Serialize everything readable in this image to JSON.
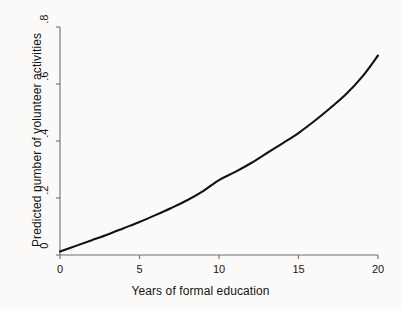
{
  "figure": {
    "background_color": "#fbfaf8",
    "axis_color": "#6e6e6e",
    "line_color": "#111111"
  },
  "chart_data": {
    "type": "line",
    "title": "",
    "subtitle": "",
    "xlabel": "Years of formal education",
    "ylabel": "Predicted number of volunteer activities",
    "xlim": [
      0,
      20
    ],
    "ylim": [
      0,
      0.8
    ],
    "xticks": [
      0,
      5,
      10,
      15,
      20
    ],
    "xtick_labels": [
      "0",
      "5",
      "10",
      "15",
      "20"
    ],
    "yticks": [
      0,
      0.2,
      0.4,
      0.6,
      0.8
    ],
    "ytick_labels": [
      "0",
      ".2",
      ".4",
      ".6",
      ".8"
    ],
    "grid": false,
    "legend": null,
    "legend_position": "none",
    "annotations": [],
    "series": [
      {
        "name": "Predicted volunteer activities",
        "color": "#111111",
        "x": [
          0,
          1,
          2,
          3,
          4,
          5,
          6,
          7,
          8,
          9,
          10,
          11,
          12,
          13,
          14,
          15,
          16,
          17,
          18,
          19,
          20
        ],
        "values": [
          0.012,
          0.032,
          0.052,
          0.072,
          0.094,
          0.116,
          0.14,
          0.165,
          0.192,
          0.224,
          0.263,
          0.291,
          0.322,
          0.357,
          0.392,
          0.428,
          0.47,
          0.516,
          0.565,
          0.625,
          0.7
        ]
      }
    ]
  }
}
